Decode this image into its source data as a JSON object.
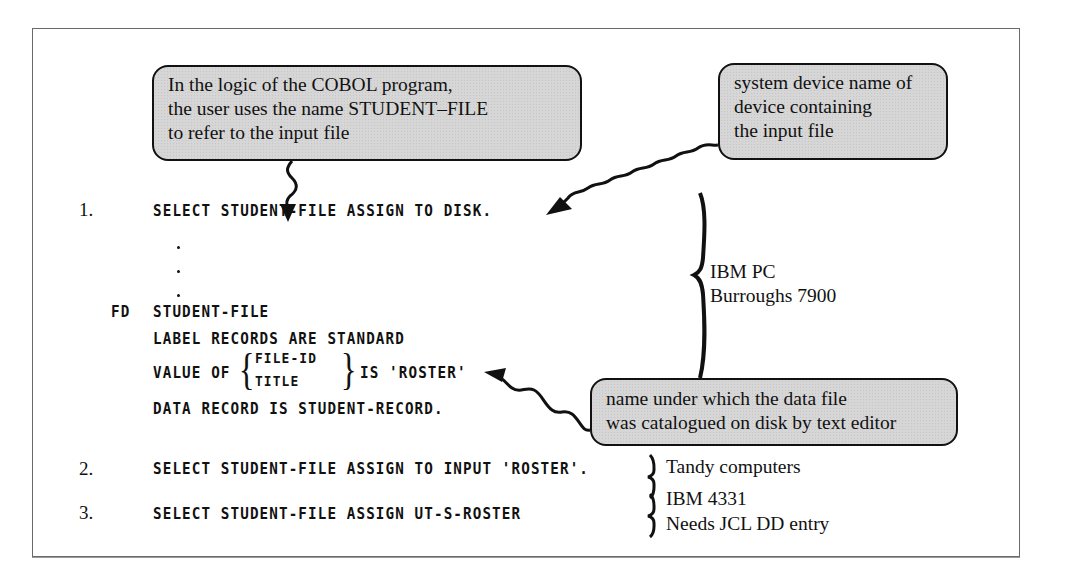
{
  "callouts": {
    "logical_name": "In the logic of the COBOL program,\nthe user uses the name STUDENT–FILE\nto refer to the input file",
    "device_name": "system device name of\ndevice containing\nthe input file",
    "catalog_name": "name under which the data file\nwas catalogued on disk by text editor"
  },
  "examples": [
    {
      "number": "1.",
      "line": "SELECT STUDENT-FILE ASSIGN TO DISK."
    },
    {
      "number": "2.",
      "line": "SELECT STUDENT-FILE ASSIGN TO INPUT 'ROSTER'."
    },
    {
      "number": "3.",
      "line": "SELECT STUDENT-FILE ASSIGN UT-S-ROSTER"
    }
  ],
  "fd_block": {
    "fd_keyword": "FD",
    "fd_name": "STUDENT-FILE",
    "label_records": "LABEL RECORDS ARE STANDARD",
    "value_of": "VALUE OF",
    "options": [
      "FILE-ID",
      "TITLE"
    ],
    "is_value": "IS 'ROSTER'",
    "data_record": "DATA RECORD IS STUDENT-RECORD."
  },
  "systems": {
    "example1": [
      "IBM PC",
      "Burroughs 7900"
    ],
    "example2": [
      "Tandy computers"
    ],
    "example3": [
      "IBM 4331",
      "Needs JCL DD entry"
    ]
  },
  "colors": {
    "callout_fill": "#d6d6d6",
    "ink": "#111111",
    "frame": "#6a6a6a"
  }
}
